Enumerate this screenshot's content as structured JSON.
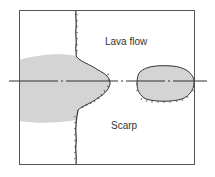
{
  "diagram": {
    "type": "plan-view schematic",
    "labels": {
      "lava_flow": "Lava flow",
      "scarp": "Scarp"
    },
    "colors": {
      "background": "#ffffff",
      "frame": "#555555",
      "fill": "#d4d4d4",
      "outline": "#333333",
      "axis": "#333333",
      "text": "#333333"
    },
    "elements": [
      {
        "name": "frame",
        "description": "rectangular border"
      },
      {
        "name": "scarp-line",
        "description": "vertical hachured scarp line crossing the frame"
      },
      {
        "name": "lava-lobe-main",
        "description": "gray lava flow lobe extending right of scarp, bounded by hachured edge"
      },
      {
        "name": "lava-island",
        "description": "isolated gray oval lava patch to the right"
      },
      {
        "name": "axis-line",
        "description": "horizontal dash-dot center axis"
      }
    ]
  }
}
